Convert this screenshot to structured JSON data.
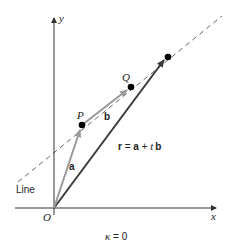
{
  "diagram": {
    "axes": {
      "x_label": "x",
      "y_label": "y",
      "origin_label": "O"
    },
    "points": {
      "P": "P",
      "Q": "Q"
    },
    "vectors": {
      "a": "a",
      "b": "b",
      "r_lhs": "r",
      "r_eq": " = ",
      "r_a": "a",
      "r_plus": " + ",
      "r_t": "t",
      "r_b": "b"
    },
    "line_label": "Line",
    "caption": {
      "kappa": "κ",
      "eq": " = 0"
    },
    "colors": {
      "axis": "#333333",
      "vector_light": "#9a9a9a",
      "vector_dark": "#3a3a3a",
      "dashed_line": "#555555",
      "point": "#000000"
    }
  }
}
